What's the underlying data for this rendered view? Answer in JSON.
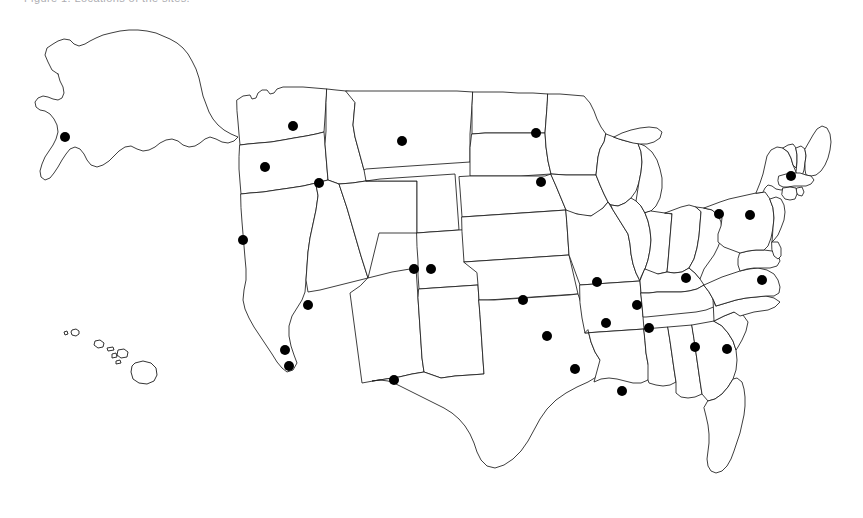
{
  "figure": {
    "caption": "Figure 1. Locations of the sites.",
    "background_color": "#ffffff",
    "outline_color": "#1c1c1c",
    "marker_color": "#000000",
    "width": 863,
    "height": 518
  },
  "chart_data": {
    "type": "scatter",
    "title": "Figure 1. Locations of the sites.",
    "subtitle": "",
    "xlabel": "",
    "ylabel": "",
    "projection": "United States (Albers-style) with Alaska and Hawaii insets",
    "grid": false,
    "legend": false,
    "axis_visible": false,
    "xlim": [
      0,
      863
    ],
    "ylim": [
      0,
      518
    ],
    "marker": {
      "shape": "circle",
      "color": "#000000",
      "diameter_px": 10,
      "count": 26
    },
    "regions": [
      {
        "name": "Continental United States",
        "kind": "map-outline"
      },
      {
        "name": "Alaska",
        "kind": "inset"
      },
      {
        "name": "Hawaii",
        "kind": "inset"
      }
    ],
    "points": [
      {
        "label": "Alaska",
        "state": "AK",
        "x": 65,
        "y": 137
      },
      {
        "label": "Washington",
        "state": "WA",
        "x": 293,
        "y": 126
      },
      {
        "label": "Oregon",
        "state": "OR",
        "x": 265,
        "y": 167
      },
      {
        "label": "Idaho",
        "state": "ID",
        "x": 319,
        "y": 183
      },
      {
        "label": "Montana",
        "state": "MT",
        "x": 402,
        "y": 141
      },
      {
        "label": "North Dakota",
        "state": "ND",
        "x": 536,
        "y": 133
      },
      {
        "label": "Minnesota",
        "state": "MN",
        "x": 541,
        "y": 182
      },
      {
        "label": "Nevada",
        "state": "NV",
        "x": 243,
        "y": 240
      },
      {
        "label": "Colorado West",
        "state": "CO",
        "x": 414,
        "y": 269
      },
      {
        "label": "Colorado East",
        "state": "CO",
        "x": 431,
        "y": 269
      },
      {
        "label": "California North",
        "state": "CA",
        "x": 308,
        "y": 305
      },
      {
        "label": "California South",
        "state": "CA",
        "x": 285,
        "y": 350
      },
      {
        "label": "California Far South",
        "state": "CA",
        "x": 289,
        "y": 366
      },
      {
        "label": "Arizona",
        "state": "AZ",
        "x": 394,
        "y": 380
      },
      {
        "label": "Kansas",
        "state": "KS",
        "x": 523,
        "y": 300
      },
      {
        "label": "Missouri West",
        "state": "MO",
        "x": 597,
        "y": 282
      },
      {
        "label": "Missouri East",
        "state": "MO",
        "x": 637,
        "y": 305
      },
      {
        "label": "Oklahoma",
        "state": "OK",
        "x": 547,
        "y": 336
      },
      {
        "label": "Texas North",
        "state": "TX",
        "x": 575,
        "y": 369
      },
      {
        "label": "Arkansas",
        "state": "AR",
        "x": 606,
        "y": 323
      },
      {
        "label": "Tennessee",
        "state": "TN",
        "x": 649,
        "y": 328
      },
      {
        "label": "Mississippi",
        "state": "MS",
        "x": 622,
        "y": 391
      },
      {
        "label": "Kentucky",
        "state": "KY",
        "x": 686,
        "y": 278
      },
      {
        "label": "Georgia",
        "state": "GA",
        "x": 695,
        "y": 347
      },
      {
        "label": "South Carolina",
        "state": "SC",
        "x": 727,
        "y": 349
      },
      {
        "label": "Pennsylvania West",
        "state": "PA",
        "x": 719,
        "y": 214
      },
      {
        "label": "Pennsylvania East",
        "state": "PA",
        "x": 750,
        "y": 215
      },
      {
        "label": "Massachusetts",
        "state": "MA",
        "x": 791,
        "y": 176
      },
      {
        "label": "Virginia",
        "state": "VA",
        "x": 762,
        "y": 280
      }
    ]
  }
}
